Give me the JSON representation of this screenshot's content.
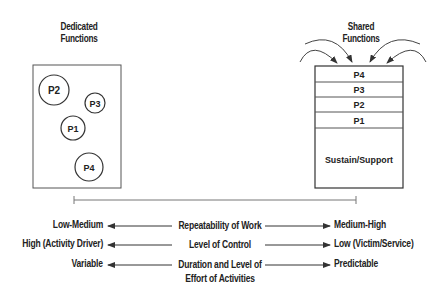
{
  "left_panel": {
    "title_line1": "Dedicated",
    "title_line2": "Functions",
    "circles": [
      {
        "label": "P2",
        "cx": 54,
        "cy": 90,
        "r": 15
      },
      {
        "label": "P3",
        "cx": 95,
        "cy": 103,
        "r": 10
      },
      {
        "label": "P1",
        "cx": 73,
        "cy": 128,
        "r": 12
      },
      {
        "label": "P4",
        "cx": 89,
        "cy": 167,
        "r": 14
      }
    ]
  },
  "right_panel": {
    "title_line1": "Shared",
    "title_line2": "Functions",
    "rows": [
      "P4",
      "P3",
      "P2",
      "P1"
    ],
    "base_label": "Sustain/Support"
  },
  "comparisons": [
    {
      "left": "Low-Medium",
      "middle_line1": "Repeatability of Work",
      "middle_line2": "",
      "right": "Medium-High"
    },
    {
      "left": "High (Activity Driver)",
      "middle_line1": "Level of Control",
      "middle_line2": "",
      "right": "Low (Victim/Service)"
    },
    {
      "left": "Variable",
      "middle_line1": "Duration and Level of",
      "middle_line2": "Effort of Activities",
      "right": "Predictable"
    }
  ],
  "colors": {
    "stroke": "#333333",
    "text": "#222222",
    "divider": "#555555"
  }
}
